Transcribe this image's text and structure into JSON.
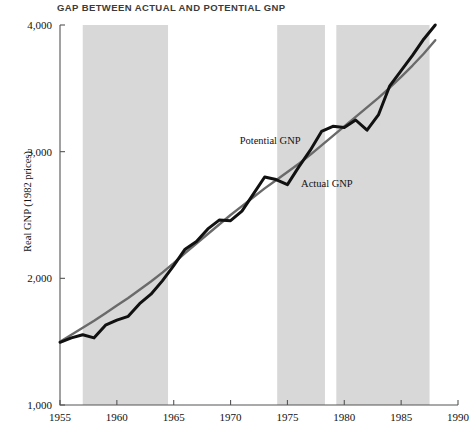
{
  "chart_data": {
    "type": "line",
    "title": "GAP BETWEEN ACTUAL AND POTENTIAL GNP",
    "xlabel": "",
    "ylabel": "Real GNP (1982 prices)",
    "xlim": [
      1955,
      1990
    ],
    "ylim": [
      1000,
      4000
    ],
    "xticks": [
      1955,
      1960,
      1965,
      1970,
      1975,
      1980,
      1985,
      1990
    ],
    "xtick_labels": [
      "1955",
      "1960",
      "1965",
      "1970",
      "1975",
      "1980",
      "1985",
      "1990"
    ],
    "yticks": [
      1000,
      2000,
      3000,
      4000
    ],
    "ytick_labels": [
      "1,000",
      "2,000",
      "3,000",
      "4,000"
    ],
    "grid": false,
    "legend_position": "inline-annotations",
    "shaded_bands": {
      "label": "recession-band",
      "color": "#d8d8d8",
      "ranges": [
        {
          "start": 1957.0,
          "end": 1964.5
        },
        {
          "start": 1974.1,
          "end": 1978.3
        },
        {
          "start": 1979.3,
          "end": 1987.5
        }
      ]
    },
    "series": [
      {
        "name": "Potential GNP",
        "color": "#6a6a6a",
        "width": 2.4,
        "label_text": "Potential GNP",
        "label_x": 1970.8,
        "label_y": 3060,
        "x": [
          1955,
          1956,
          1957,
          1958,
          1959,
          1960,
          1961,
          1962,
          1963,
          1964,
          1965,
          1966,
          1967,
          1968,
          1969,
          1970,
          1971,
          1972,
          1973,
          1974,
          1975,
          1976,
          1977,
          1978,
          1979,
          1980,
          1981,
          1982,
          1983,
          1984,
          1985,
          1986,
          1987,
          1988
        ],
        "y": [
          1500,
          1555,
          1610,
          1665,
          1725,
          1785,
          1845,
          1910,
          1975,
          2045,
          2120,
          2200,
          2275,
          2350,
          2425,
          2500,
          2570,
          2640,
          2710,
          2775,
          2840,
          2905,
          2975,
          3050,
          3125,
          3200,
          3275,
          3350,
          3425,
          3505,
          3590,
          3680,
          3775,
          3880
        ]
      },
      {
        "name": "Actual GNP",
        "color": "#111111",
        "width": 3.0,
        "label_text": "Actual GNP",
        "label_x": 1976.2,
        "label_y": 2720,
        "x": [
          1955,
          1956,
          1957,
          1958,
          1959,
          1960,
          1961,
          1962,
          1963,
          1964,
          1965,
          1966,
          1967,
          1968,
          1969,
          1970,
          1971,
          1972,
          1973,
          1974,
          1975,
          1976,
          1977,
          1978,
          1979,
          1980,
          1981,
          1982,
          1983,
          1984,
          1985,
          1986,
          1987,
          1988
        ],
        "y": [
          1495,
          1530,
          1555,
          1530,
          1630,
          1670,
          1700,
          1800,
          1875,
          1980,
          2100,
          2230,
          2290,
          2390,
          2460,
          2455,
          2530,
          2665,
          2800,
          2780,
          2740,
          2880,
          3010,
          3160,
          3200,
          3190,
          3250,
          3170,
          3290,
          3520,
          3640,
          3760,
          3890,
          4000
        ]
      }
    ]
  }
}
